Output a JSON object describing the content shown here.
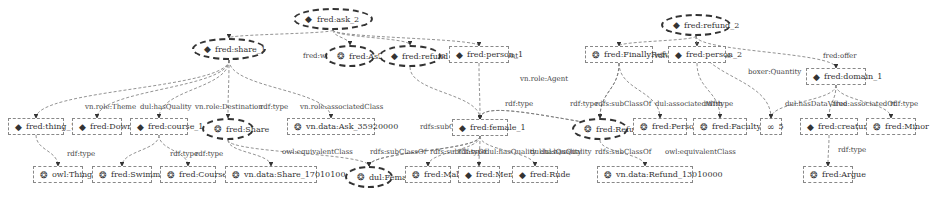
{
  "nodes": [
    {
      "id": "ask2",
      "label": "fred:ask_2",
      "x": 293,
      "y": 8,
      "w": 80,
      "shape": "oval",
      "icon": "diamond-icon"
    },
    {
      "id": "refund2",
      "label": "fred:refund_2",
      "x": 661,
      "y": 14,
      "w": 70,
      "shape": "oval",
      "icon": "diamond-icon"
    },
    {
      "id": "share1",
      "label": "fred:share_1",
      "x": 192,
      "y": 38,
      "w": 74,
      "shape": "oval",
      "icon": "diamond-icon"
    },
    {
      "id": "Ask",
      "label": "fred:Ask",
      "x": 325,
      "y": 45,
      "w": 50,
      "shape": "oval",
      "icon": "gear-icon"
    },
    {
      "id": "refund1",
      "label": "fred:refund_1",
      "x": 379,
      "y": 45,
      "w": 62,
      "shape": "oval",
      "icon": "diamond-icon"
    },
    {
      "id": "person1",
      "label": "fred:person_1",
      "x": 449,
      "y": 46,
      "w": 60,
      "shape": "box",
      "icon": "diamond-icon"
    },
    {
      "id": "FinallyRefund",
      "label": "fred:FinallyRefund",
      "x": 585,
      "y": 46,
      "w": 68,
      "shape": "box",
      "icon": "gear-icon"
    },
    {
      "id": "person2",
      "label": "fred:person_2",
      "x": 668,
      "y": 46,
      "w": 58,
      "shape": "box",
      "icon": "diamond-icon"
    },
    {
      "id": "domain1",
      "label": "fred:domain_1",
      "x": 806,
      "y": 68,
      "w": 60,
      "shape": "box",
      "icon": "diamond-icon"
    },
    {
      "id": "thing1",
      "label": "fred:thing_1",
      "x": 8,
      "y": 118,
      "w": 56,
      "shape": "box",
      "icon": "diamond-icon"
    },
    {
      "id": "Down",
      "label": "fred:Down",
      "x": 72,
      "y": 118,
      "w": 50,
      "shape": "box",
      "icon": "diamond-icon"
    },
    {
      "id": "course1",
      "label": "fred:course_1",
      "x": 130,
      "y": 118,
      "w": 58,
      "shape": "box",
      "icon": "diamond-icon"
    },
    {
      "id": "Share",
      "label": "fred:Share",
      "x": 202,
      "y": 118,
      "w": 52,
      "shape": "oval",
      "icon": "gear-icon"
    },
    {
      "id": "AskDate",
      "label": "vn.data:Ask_35920000",
      "x": 287,
      "y": 118,
      "w": 88,
      "shape": "box",
      "icon": "gear-icon"
    },
    {
      "id": "female1",
      "label": "fred:female_1",
      "x": 452,
      "y": 119,
      "w": 56,
      "shape": "box",
      "icon": "diamond-icon"
    },
    {
      "id": "Refund",
      "label": "fred:Refund",
      "x": 572,
      "y": 118,
      "w": 56,
      "shape": "oval",
      "icon": "gear-icon"
    },
    {
      "id": "Person",
      "label": "fred:Person",
      "x": 633,
      "y": 118,
      "w": 54,
      "shape": "box",
      "icon": "gear-icon"
    },
    {
      "id": "Faculty",
      "label": "fred:Faculty",
      "x": 693,
      "y": 118,
      "w": 54,
      "shape": "box",
      "icon": "gear-icon"
    },
    {
      "id": "five",
      "label": "5",
      "x": 760,
      "y": 118,
      "w": 22,
      "shape": "box",
      "icon": "infinity-icon"
    },
    {
      "id": "creature2",
      "label": "fred:creature_2",
      "x": 800,
      "y": 118,
      "w": 58,
      "shape": "box",
      "icon": "diamond-icon"
    },
    {
      "id": "Minor",
      "label": "fred:Minor",
      "x": 866,
      "y": 118,
      "w": 50,
      "shape": "box",
      "icon": "gear-icon"
    },
    {
      "id": "owlThing",
      "label": "owl:Thing",
      "x": 33,
      "y": 166,
      "w": 50,
      "shape": "box",
      "icon": "gear-icon"
    },
    {
      "id": "Swimming",
      "label": "fred:Swimming",
      "x": 92,
      "y": 166,
      "w": 60,
      "shape": "box",
      "icon": "gear-icon"
    },
    {
      "id": "Course",
      "label": "fred:Course",
      "x": 160,
      "y": 166,
      "w": 56,
      "shape": "box",
      "icon": "gear-icon"
    },
    {
      "id": "ShareDate",
      "label": "vn.data:Share_17010100",
      "x": 225,
      "y": 166,
      "w": 92,
      "shape": "box",
      "icon": "gear-icon"
    },
    {
      "id": "Female",
      "label": "dul:Female",
      "x": 345,
      "y": 166,
      "w": 48,
      "shape": "oval",
      "icon": "gear-icon"
    },
    {
      "id": "Male",
      "label": "fred:Male",
      "x": 405,
      "y": 166,
      "w": 46,
      "shape": "box",
      "icon": "gear-icon"
    },
    {
      "id": "Men",
      "label": "fred:Men",
      "x": 458,
      "y": 166,
      "w": 42,
      "shape": "box",
      "icon": "diamond-icon"
    },
    {
      "id": "Rude",
      "label": "fred:Rude",
      "x": 512,
      "y": 166,
      "w": 46,
      "shape": "box",
      "icon": "diamond-icon"
    },
    {
      "id": "RefundDate",
      "label": "vn.data:Refund_13010000",
      "x": 597,
      "y": 166,
      "w": 96,
      "shape": "box",
      "icon": "gear-icon"
    },
    {
      "id": "Argue",
      "label": "fred:Argue",
      "x": 803,
      "y": 166,
      "w": 50,
      "shape": "box",
      "icon": "gear-icon"
    }
  ],
  "edges": [
    {
      "from": "ask2",
      "to": "share1",
      "label": "fred:when",
      "lx": 303,
      "ly": 52
    },
    {
      "from": "ask2",
      "to": "Ask",
      "label": "rdf:type",
      "lx": 330,
      "ly": 52
    },
    {
      "from": "ask2",
      "to": "refund1",
      "label": "vn.role:Proposition",
      "lx": 378,
      "ly": 52
    },
    {
      "from": "ask2",
      "to": "person1",
      "label": "vn.role:Agent",
      "lx": 470,
      "ly": 52
    },
    {
      "from": "refund2",
      "to": "FinallyRefund",
      "label": "rdf:type",
      "lx": 655,
      "ly": 52
    },
    {
      "from": "refund2",
      "to": "person2",
      "label": "vn.role:Theme",
      "lx": 680,
      "ly": 52
    },
    {
      "from": "refund2",
      "to": "five",
      "label": "boxer:Quantity",
      "lx": 748,
      "ly": 68
    },
    {
      "from": "refund2",
      "to": "domain1",
      "label": "fred:offer",
      "lx": 823,
      "ly": 52
    },
    {
      "from": "refund1",
      "to": "female1",
      "label": "vn.role:Agent",
      "lx": 520,
      "ly": 75
    },
    {
      "from": "domain1",
      "to": "five",
      "label": "dul:hasDataValue",
      "lx": 785,
      "ly": 100
    },
    {
      "from": "domain1",
      "to": "creature2",
      "label": "fred:associatedOf",
      "lx": 833,
      "ly": 100
    },
    {
      "from": "domain1",
      "to": "Minor",
      "label": "rdf:type",
      "lx": 890,
      "ly": 100
    },
    {
      "from": "creature2",
      "to": "Argue",
      "label": "rdf:type",
      "lx": 838,
      "ly": 146
    },
    {
      "from": "share1",
      "to": "thing1",
      "label": "vn.role:Theme",
      "lx": 85,
      "ly": 103
    },
    {
      "from": "share1",
      "to": "Down",
      "label": "dul:hasQuality",
      "lx": 140,
      "ly": 103
    },
    {
      "from": "share1",
      "to": "course1",
      "label": "vn.role:Destination",
      "lx": 195,
      "ly": 103
    },
    {
      "from": "share1",
      "to": "Share",
      "label": "rdf:type",
      "lx": 260,
      "ly": 103
    },
    {
      "from": "share1",
      "to": "AskDate",
      "label": "vn.role:associatedClass",
      "lx": 300,
      "ly": 103
    },
    {
      "from": "thing1",
      "to": "owlThing",
      "label": "rdf:type",
      "lx": 67,
      "ly": 150
    },
    {
      "from": "course1",
      "to": "Swimming",
      "label": "rdf:type",
      "lx": 170,
      "ly": 150
    },
    {
      "from": "course1",
      "to": "Course",
      "label": "rdf:type",
      "lx": 195,
      "ly": 150
    },
    {
      "from": "Share",
      "to": "ShareDate",
      "label": "owl:equivalentClass",
      "lx": 282,
      "ly": 148
    },
    {
      "from": "female1",
      "to": "Female",
      "label": "rdfs:subClassOf",
      "lx": 420,
      "ly": 123
    },
    {
      "from": "Share",
      "to": "Female",
      "label": "rdfs:subClassOf",
      "lx": 370,
      "ly": 148
    },
    {
      "from": "female1",
      "to": "Male",
      "label": "rdf:type",
      "lx": 458,
      "ly": 148
    },
    {
      "from": "female1",
      "to": "Men",
      "label": "dul:hasQuality",
      "lx": 485,
      "ly": 148
    },
    {
      "from": "female1",
      "to": "Rude",
      "label": "dul:hasQuality",
      "lx": 540,
      "ly": 148
    },
    {
      "from": "person1",
      "to": "female1",
      "label": "rdf:type",
      "lx": 505,
      "ly": 100
    },
    {
      "from": "FinallyRefund",
      "to": "Refund",
      "label": "rdf:type",
      "lx": 570,
      "ly": 100
    },
    {
      "from": "FinallyRefund",
      "to": "Refund",
      "label": "rdfs:subClassOf",
      "lx": 595,
      "ly": 100
    },
    {
      "from": "FinallyRefund",
      "to": "Person",
      "label": "dul:associatedWith",
      "lx": 655,
      "ly": 100
    },
    {
      "from": "person2",
      "to": "Faculty",
      "label": "rdf:type",
      "lx": 705,
      "ly": 100
    },
    {
      "from": "Refund",
      "to": "RefundDate",
      "label": "owl:equivalentClass",
      "lx": 665,
      "ly": 148
    },
    {
      "from": "Refund",
      "to": "female1",
      "label": "dul:hasQuality",
      "lx": 530,
      "ly": 148
    },
    {
      "from": "Refund",
      "to": "female1",
      "label": "rdfs:subClassOf",
      "lx": 595,
      "ly": 148
    },
    {
      "from": "female1",
      "to": "Female",
      "label": "rdfs:subClassOf",
      "lx": 430,
      "ly": 148
    }
  ],
  "colors": {
    "line": "#777777",
    "text": "#333333",
    "node_border": "#888888"
  }
}
